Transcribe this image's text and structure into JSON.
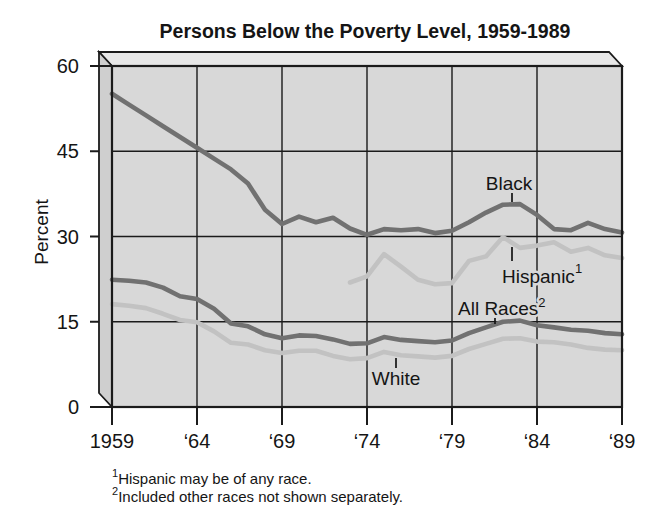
{
  "title": "Persons Below the Poverty Level, 1959-1989",
  "y_axis": {
    "label": "Percent"
  },
  "x_axis": {
    "ticks": [
      {
        "label": "1959",
        "year": 1959
      },
      {
        "label": "‘64",
        "year": 1964
      },
      {
        "label": "‘69",
        "year": 1969
      },
      {
        "label": "‘74",
        "year": 1974
      },
      {
        "label": "‘79",
        "year": 1979
      },
      {
        "label": "‘84",
        "year": 1984
      },
      {
        "label": "‘89",
        "year": 1989
      }
    ]
  },
  "annotations": {
    "black": {
      "label": "Black"
    },
    "hispanic": {
      "label": "Hispanic",
      "superscript": "1"
    },
    "all_races": {
      "label": "All Races",
      "superscript": "2"
    },
    "white": {
      "label": "White"
    }
  },
  "footnotes": [
    {
      "marker": "1",
      "text": "Hispanic may be of any race."
    },
    {
      "marker": "2",
      "text": "Included other races not shown separately."
    }
  ],
  "colors": {
    "dark_series": "#717171",
    "light_series": "#c2c2c2",
    "plot_background": "#d8d8d8",
    "box_top_face": "#e7e7e7",
    "box_left_face": "#cfcfcf",
    "axis_and_text": "#1b1b1b",
    "page_background": "#ffffff"
  },
  "chart_data": {
    "type": "line",
    "title": "Persons Below the Poverty Level, 1959-1989",
    "xlabel": "",
    "ylabel": "Percent",
    "ylim": [
      0,
      60
    ],
    "xlim": [
      1959,
      1989
    ],
    "y_tick_values": [
      0,
      15,
      30,
      45,
      60
    ],
    "x_tick_labels": [
      "1959",
      "‘64",
      "‘69",
      "‘74",
      "‘79",
      "‘84",
      "‘89"
    ],
    "grid": true,
    "legend": "inline labels with leader lines",
    "frequency": "annual",
    "series": [
      {
        "name": "Black",
        "color": "#717171",
        "start_year": 1959,
        "values": [
          55.1,
          53.2,
          51.3,
          49.4,
          47.5,
          45.6,
          43.7,
          41.8,
          39.3,
          34.7,
          32.2,
          33.5,
          32.5,
          33.3,
          31.4,
          30.3,
          31.3,
          31.1,
          31.3,
          30.6,
          31.0,
          32.5,
          34.2,
          35.6,
          35.7,
          33.8,
          31.3,
          31.1,
          32.4,
          31.3,
          30.7
        ]
      },
      {
        "name": "Hispanic",
        "color": "#c2c2c2",
        "start_year": 1973,
        "values": [
          21.9,
          23.0,
          26.9,
          24.7,
          22.4,
          21.6,
          21.8,
          25.7,
          26.5,
          29.9,
          28.0,
          28.4,
          29.0,
          27.3,
          28.0,
          26.7,
          26.2
        ]
      },
      {
        "name": "All Races",
        "color": "#717171",
        "start_year": 1959,
        "values": [
          22.4,
          22.2,
          21.9,
          21.0,
          19.5,
          19.0,
          17.3,
          14.7,
          14.2,
          12.8,
          12.1,
          12.6,
          12.5,
          11.9,
          11.1,
          11.2,
          12.3,
          11.8,
          11.6,
          11.4,
          11.7,
          13.0,
          14.0,
          15.0,
          15.2,
          14.4,
          14.0,
          13.6,
          13.4,
          13.0,
          12.8
        ]
      },
      {
        "name": "White",
        "color": "#c2c2c2",
        "start_year": 1959,
        "values": [
          18.1,
          17.8,
          17.4,
          16.4,
          15.3,
          14.9,
          13.3,
          11.3,
          11.0,
          10.0,
          9.5,
          9.9,
          9.9,
          9.0,
          8.4,
          8.6,
          9.7,
          9.1,
          8.9,
          8.7,
          9.0,
          10.2,
          11.1,
          12.0,
          12.1,
          11.5,
          11.4,
          11.0,
          10.4,
          10.1,
          10.0
        ]
      }
    ]
  }
}
